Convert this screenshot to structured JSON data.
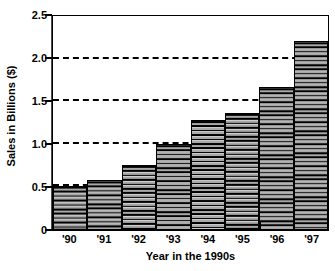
{
  "chart_data": {
    "type": "bar",
    "title": "",
    "xlabel": "Year in the 1990s",
    "ylabel": "Sales in Billions ($)",
    "categories": [
      "'90",
      "'91",
      "'92",
      "'93",
      "'94",
      "'95",
      "'96",
      "'97"
    ],
    "values": [
      0.5,
      0.58,
      0.75,
      1.0,
      1.28,
      1.36,
      1.67,
      2.21
    ],
    "ylim": [
      0,
      2.5
    ],
    "y_ticks": [
      0,
      0.5,
      1.0,
      1.5,
      2.0,
      2.5
    ],
    "y_tick_labels": [
      "0",
      "0.5",
      "1.0",
      "1.5",
      "2.0",
      "2.5"
    ],
    "gridlines": [
      0.5,
      1.0,
      1.5,
      2.0
    ],
    "grid": "horizontal-dashed",
    "legend": "none",
    "bar_fill": "horizontal-line-hatch",
    "bar_fill_color": "#b9b9b9",
    "bar_edge_color": "#000000",
    "axis_color": "#000000",
    "background_color": "#ffffff"
  }
}
